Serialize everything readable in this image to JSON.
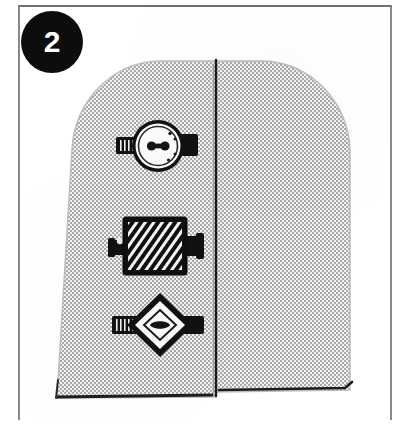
{
  "figure": {
    "kind": "instruction-illustration",
    "caption_number": "2",
    "background_color": "#ffffff",
    "frame_border_color": "#8a8a8a",
    "ink_color": "#111111"
  },
  "badge": {
    "label": "2",
    "shape": "circle",
    "fill_color": "#0d0d0d",
    "text_color": "#ffffff"
  },
  "panel": {
    "name": "arched-panel",
    "fill_color": "#d8d8d8",
    "pattern": "halftone-dither",
    "outline_color": "#1a1a1a",
    "seam": {
      "name": "vertical-seam",
      "x": 216,
      "color": "#1a1a1a"
    },
    "left_section_label": "left panel",
    "right_section_label": "right panel"
  },
  "fittings": [
    {
      "name": "round-gauge-fitting",
      "shape": "circle",
      "position_label": "top",
      "cx": 158,
      "cy": 146,
      "face_color": "#ffffff",
      "body_color": "#111111",
      "has_left_pipe": true,
      "has_right_pipe": true
    },
    {
      "name": "hatched-block-fitting",
      "shape": "rectangle",
      "position_label": "middle",
      "cx": 155,
      "cy": 246,
      "face_color": "#111111",
      "body_color": "#111111",
      "has_left_pipe": true,
      "has_right_pipe": true
    },
    {
      "name": "diamond-valve-fitting",
      "shape": "diamond",
      "position_label": "bottom",
      "cx": 160,
      "cy": 325,
      "face_color": "#ffffff",
      "body_color": "#111111",
      "has_left_pipe": true,
      "has_right_pipe": true
    }
  ]
}
